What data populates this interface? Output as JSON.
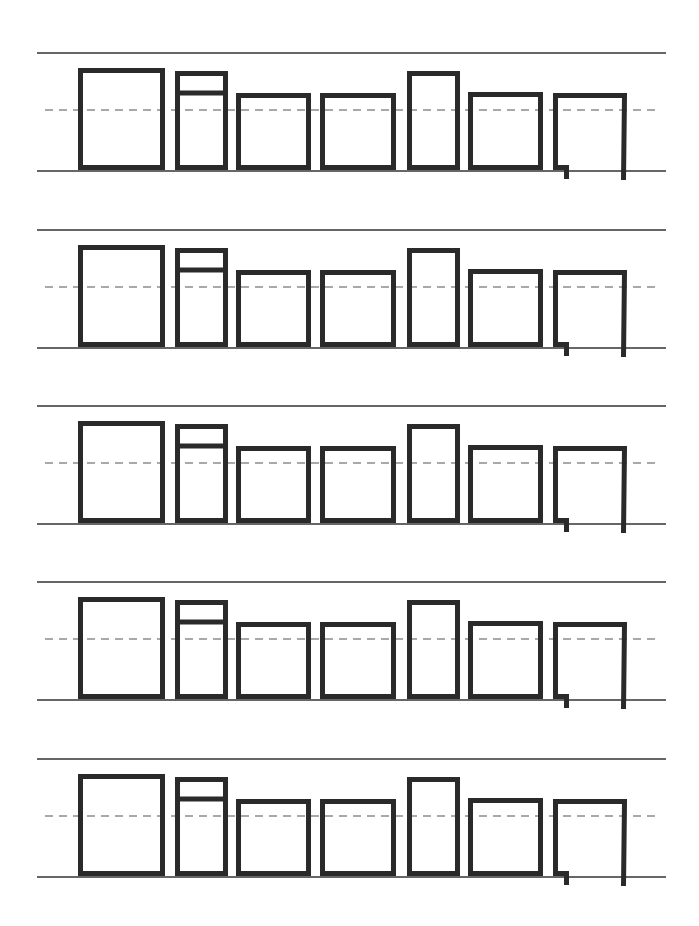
{
  "worksheet": {
    "title": "",
    "background": "#ffffff",
    "ink_color": "#2a2a2a",
    "guide_color": "#333333",
    "dash_color": "#555555",
    "row_count": 5,
    "row_tops": [
      53,
      230,
      406,
      582,
      759
    ],
    "row_baseline_offset": 118,
    "row_midline_offset": 57,
    "guide_line": {
      "x1": 37,
      "x2": 666
    },
    "mid_line": {
      "x1": 45,
      "x2": 655,
      "dash": "8 6"
    },
    "stroke_width": 5,
    "boxes": [
      {
        "name": "box-1-tall-wide",
        "x1": 78,
        "x2": 165,
        "top_offset": 15,
        "divider_offset": null,
        "open_bottom": false
      },
      {
        "name": "box-2-split",
        "x1": 175,
        "x2": 228,
        "top_offset": 18,
        "divider_offset": 40,
        "open_bottom": false
      },
      {
        "name": "box-3-short-wide",
        "x1": 236,
        "x2": 311,
        "top_offset": 40,
        "divider_offset": null,
        "open_bottom": false
      },
      {
        "name": "box-4-short-wide",
        "x1": 320,
        "x2": 396,
        "top_offset": 40,
        "divider_offset": null,
        "open_bottom": false
      },
      {
        "name": "box-5-tall-narrow",
        "x1": 407,
        "x2": 460,
        "top_offset": 18,
        "divider_offset": null,
        "open_bottom": false
      },
      {
        "name": "box-6-short-wide",
        "x1": 468,
        "x2": 543,
        "top_offset": 39,
        "divider_offset": null,
        "open_bottom": false
      },
      {
        "name": "box-7-descender",
        "x1": 553,
        "x2": 627,
        "top_offset": 40,
        "divider_offset": null,
        "open_bottom": true,
        "descender": 9
      }
    ]
  }
}
